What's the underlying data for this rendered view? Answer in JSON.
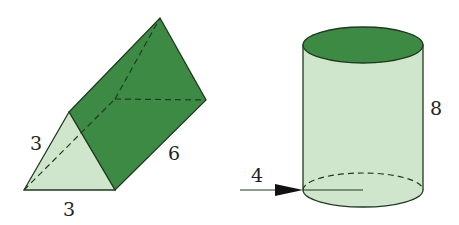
{
  "figure": {
    "prism": {
      "name": "triangular prism",
      "labels": {
        "triangle_left_side": "3",
        "triangle_base": "3",
        "length": "6"
      }
    },
    "cylinder": {
      "name": "cylinder",
      "labels": {
        "height": "8",
        "radius": "4"
      }
    }
  },
  "colors": {
    "dark_green": "#3d8a45",
    "light_green": "#cfe6cc",
    "outline": "#1f3a1f"
  }
}
